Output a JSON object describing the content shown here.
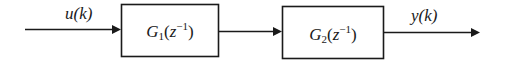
{
  "diagram": {
    "type": "block-diagram",
    "input": {
      "label": "u(k)"
    },
    "output": {
      "label": "y(k)"
    },
    "blocks": [
      {
        "name": "G",
        "subscript": "1",
        "arg_open": "(",
        "arg_var": "z",
        "arg_exp": "−1",
        "arg_close": ")"
      },
      {
        "name": "G",
        "subscript": "2",
        "arg_open": "(",
        "arg_var": "z",
        "arg_exp": "−1",
        "arg_close": ")"
      }
    ],
    "connections": [
      "input→G1",
      "G1→G2",
      "G2→output"
    ],
    "colors": {
      "stroke": "#1a1a1a",
      "background": "#ffffff"
    }
  }
}
